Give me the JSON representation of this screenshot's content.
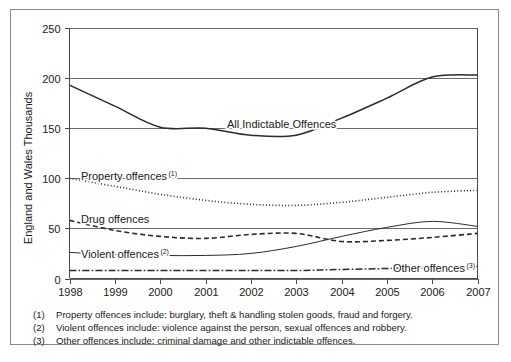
{
  "chart_data": {
    "type": "line",
    "title": "",
    "xlabel": "",
    "ylabel": "England and Wales Thousands",
    "x": [
      1998,
      1999,
      2000,
      2001,
      2002,
      2003,
      2004,
      2005,
      2006,
      2007
    ],
    "xticklabels": [
      "1998",
      "1999",
      "2000",
      "2001",
      "2002",
      "2003",
      "2004",
      "2005",
      "2006",
      "2007"
    ],
    "yticks": [
      0,
      50,
      100,
      150,
      200,
      250
    ],
    "yticklabels": [
      "0",
      "50",
      "100",
      "150",
      "200",
      "250"
    ],
    "ylim": [
      0,
      250
    ],
    "xlim": [
      1998,
      2007
    ],
    "grid": true,
    "legend_position": "inline-annotations",
    "series": [
      {
        "name": "All Indictable Offences",
        "style": "solid",
        "width": 1.5,
        "color": "#2b2b2b",
        "values": [
          193,
          172,
          151,
          150,
          143,
          143,
          160,
          180,
          201,
          203
        ]
      },
      {
        "name": "Property offences",
        "footnote": "1",
        "style": "dotted",
        "width": 1.6,
        "color": "#2b2b2b",
        "values": [
          100,
          92,
          84,
          78,
          74,
          73,
          76,
          81,
          86,
          88
        ]
      },
      {
        "name": "Drug offences",
        "style": "dashed",
        "width": 1.6,
        "color": "#2b2b2b",
        "values": [
          58,
          48,
          42,
          40,
          44,
          45,
          37,
          38,
          41,
          45
        ]
      },
      {
        "name": "Violent offences",
        "footnote": "2",
        "style": "solid",
        "width": 1,
        "color": "#2b2b2b",
        "values": [
          26,
          24,
          23,
          23,
          25,
          32,
          42,
          51,
          57,
          52
        ]
      },
      {
        "name": "Other offences",
        "footnote": "3",
        "style": "dashdot",
        "width": 1.5,
        "color": "#2b2b2b",
        "values": [
          8,
          8,
          8,
          8,
          8,
          8,
          9,
          10,
          11,
          12
        ]
      }
    ],
    "annotations": [
      {
        "text": "All Indictable Offences",
        "sup": "",
        "x": 216,
        "y": 118
      },
      {
        "text": "Property offences",
        "sup": "1",
        "x": 70,
        "y": 170
      },
      {
        "text": "Drug offences",
        "sup": "",
        "x": 70,
        "y": 213
      },
      {
        "text": "Violent offences",
        "sup": "2",
        "x": 70,
        "y": 248
      },
      {
        "text": "Other offences",
        "sup": "3",
        "x": 382,
        "y": 262
      }
    ]
  },
  "axis": {
    "y_title": "England and Wales Thousands"
  },
  "footnotes": [
    {
      "marker": "(1)",
      "text": "Property offences include: burglary, theft & handling stolen goods, fraud and forgery."
    },
    {
      "marker": "(2)",
      "text": "Violent offences include: violence against the person, sexual offences and robbery."
    },
    {
      "marker": "(3)",
      "text": "Other offences include: criminal damage and other indictable offences."
    }
  ],
  "colors": {
    "ink": "#1a1a1a",
    "line": "#2b2b2b",
    "grid": "#6b6b6b",
    "frame": "#8a8a8a",
    "background": "#ffffff"
  }
}
